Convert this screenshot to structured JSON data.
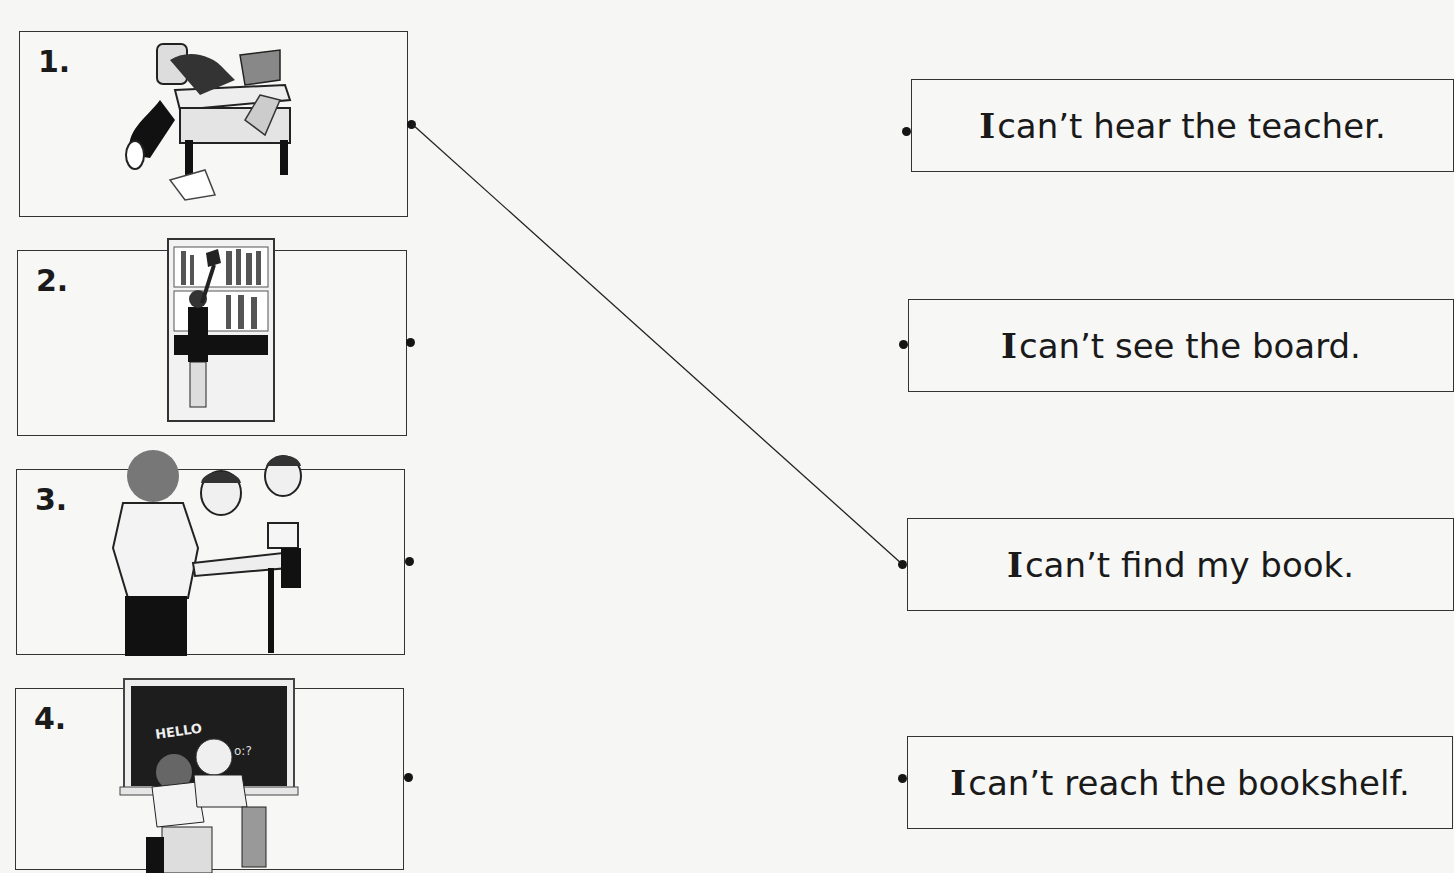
{
  "worksheet": {
    "pictures": [
      {
        "number": "1.",
        "scene": "student slumped over messy desk searching papers",
        "icon": "messy-desk-illustration"
      },
      {
        "number": "2.",
        "scene": "short student reaching up to a tall bookshelf",
        "icon": "bookshelf-illustration"
      },
      {
        "number": "3.",
        "scene": "teacher blocks view; student cups ear to hear",
        "icon": "classroom-teacher-illustration"
      },
      {
        "number": "4.",
        "scene": "students seated facing chalkboard",
        "icon": "chalkboard-illustration"
      }
    ],
    "chalkboard_text": "HELLO",
    "sentences": [
      {
        "lead": "I",
        "rest": " can’t hear the teacher."
      },
      {
        "lead": "I",
        "rest": " can’t see the board."
      },
      {
        "lead": "I",
        "rest": " can’t find my book."
      },
      {
        "lead": "I",
        "rest": " can’t reach the bookshelf."
      }
    ],
    "connections": [
      {
        "from_picture": "1.",
        "to_sentence": "I can’t find my book."
      }
    ]
  }
}
